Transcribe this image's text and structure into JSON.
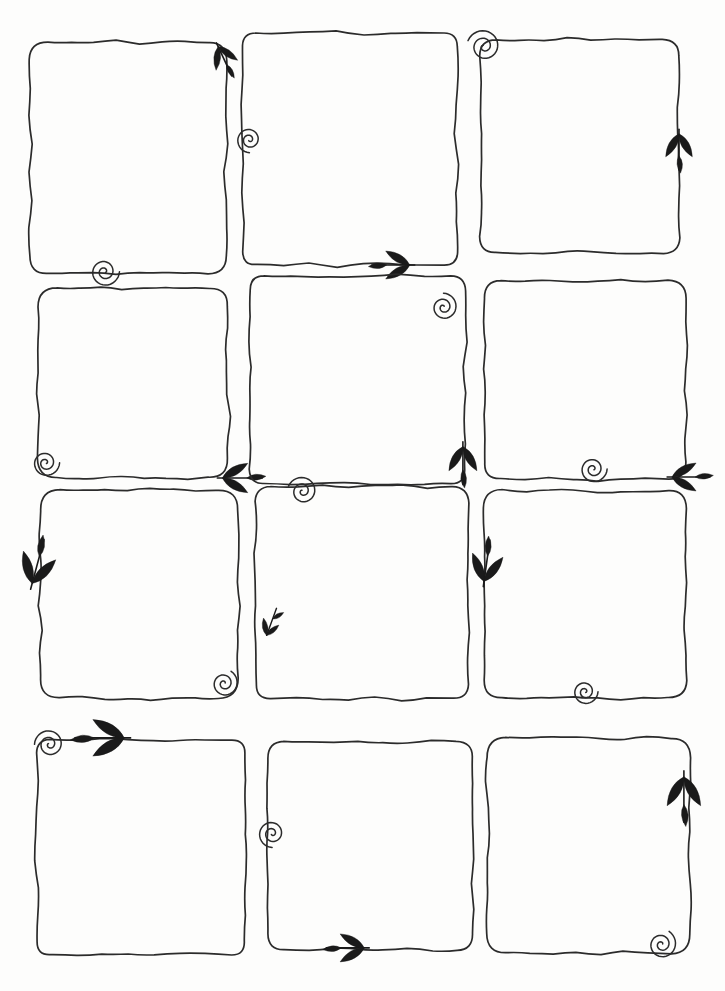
{
  "document": {
    "kind": "hand-drawn-template-sheet",
    "title": "Blank hand-drawn square frames grid",
    "medium": "ink pen on white paper",
    "background_color": "#fdfdfc",
    "ink_color": "#2b2b2b",
    "ornament_color": "#1a1a1a",
    "width": 725,
    "height": 991,
    "frame_count": 12,
    "grid": {
      "columns": 3,
      "rows": 4
    },
    "text_content": "none - all frames are empty"
  },
  "frames": [
    {
      "id": "frame-r1c1",
      "row": 1,
      "col": 1,
      "x": 30,
      "y": 42,
      "w": 196,
      "h": 232,
      "ornaments": [
        {
          "name": "leaf-arrow-down",
          "direction": "down",
          "edge": "top-right",
          "ox": 0.96,
          "oy": 0.02,
          "size": 34,
          "rot": 155
        },
        {
          "name": "spiral-curl",
          "edge": "bottom-left",
          "ox": 0.38,
          "oy": 0.99,
          "size": 15,
          "rot": 0
        }
      ]
    },
    {
      "id": "frame-r1c2",
      "row": 1,
      "col": 2,
      "x": 243,
      "y": 33,
      "w": 214,
      "h": 232,
      "ornaments": [
        {
          "name": "spiral-curl",
          "edge": "left-upper",
          "ox": 0.03,
          "oy": 0.46,
          "size": 13,
          "rot": 90
        },
        {
          "name": "leaf-arrow-right",
          "direction": "right",
          "edge": "bottom-right",
          "ox": 0.78,
          "oy": 1.0,
          "size": 40,
          "rot": 0
        }
      ]
    },
    {
      "id": "frame-r1c3",
      "row": 1,
      "col": 3,
      "x": 480,
      "y": 40,
      "w": 199,
      "h": 213,
      "ornaments": [
        {
          "name": "spiral-curl",
          "edge": "top-left",
          "ox": 0.02,
          "oy": 0.03,
          "size": 17,
          "rot": 200
        },
        {
          "name": "leaf-arrow-up",
          "direction": "up",
          "edge": "right",
          "ox": 1.0,
          "oy": 0.44,
          "size": 38,
          "rot": 0
        }
      ]
    },
    {
      "id": "frame-r2c1",
      "row": 2,
      "col": 1,
      "x": 38,
      "y": 288,
      "w": 190,
      "h": 190,
      "ornaments": [
        {
          "name": "spiral-curl",
          "edge": "bottom-left",
          "ox": 0.04,
          "oy": 0.92,
          "size": 14,
          "rot": 0
        },
        {
          "name": "leaf-arrow-left",
          "direction": "left",
          "edge": "bottom-right",
          "ox": 0.97,
          "oy": 1.0,
          "size": 42,
          "rot": 0
        }
      ]
    },
    {
      "id": "frame-r2c2",
      "row": 2,
      "col": 2,
      "x": 250,
      "y": 276,
      "w": 215,
      "h": 208,
      "ornaments": [
        {
          "name": "spiral-curl",
          "edge": "top-right",
          "ox": 0.9,
          "oy": 0.15,
          "size": 14,
          "rot": 270
        },
        {
          "name": "leaf-arrow-up",
          "direction": "up",
          "edge": "bottom-right",
          "ox": 0.99,
          "oy": 0.82,
          "size": 40,
          "rot": 0
        }
      ]
    },
    {
      "id": "frame-r2c3",
      "row": 2,
      "col": 3,
      "x": 484,
      "y": 281,
      "w": 202,
      "h": 198,
      "ornaments": [
        {
          "name": "spiral-curl",
          "edge": "bottom-left-inner",
          "ox": 0.54,
          "oy": 0.95,
          "size": 14,
          "rot": 0
        },
        {
          "name": "leaf-arrow-left",
          "direction": "left",
          "edge": "bottom-right",
          "ox": 0.93,
          "oy": 0.99,
          "size": 40,
          "rot": 0
        }
      ]
    },
    {
      "id": "frame-r3c1",
      "row": 3,
      "col": 1,
      "x": 40,
      "y": 490,
      "w": 198,
      "h": 208,
      "ornaments": [
        {
          "name": "leaf-arrow-down",
          "direction": "down",
          "edge": "left",
          "ox": -0.04,
          "oy": 0.45,
          "size": 48,
          "rot": 15
        },
        {
          "name": "spiral-curl",
          "edge": "bottom-right",
          "ox": 0.93,
          "oy": 0.93,
          "size": 14,
          "rot": 300
        }
      ]
    },
    {
      "id": "frame-r3c2",
      "row": 3,
      "col": 2,
      "x": 256,
      "y": 487,
      "w": 212,
      "h": 212,
      "ornaments": [
        {
          "name": "spiral-curl",
          "edge": "top-left-inner",
          "ox": 0.22,
          "oy": 0.02,
          "size": 15,
          "rot": 200
        },
        {
          "name": "leaf-sprig-down",
          "direction": "down",
          "edge": "left-lower",
          "ox": 0.05,
          "oy": 0.7,
          "size": 32,
          "rot": 20
        }
      ]
    },
    {
      "id": "frame-r3c3",
      "row": 3,
      "col": 3,
      "x": 484,
      "y": 490,
      "w": 202,
      "h": 208,
      "ornaments": [
        {
          "name": "leaf-arrow-down",
          "direction": "down",
          "edge": "left",
          "ox": 0.0,
          "oy": 0.44,
          "size": 44,
          "rot": 8
        },
        {
          "name": "spiral-curl",
          "edge": "bottom-center",
          "ox": 0.5,
          "oy": 0.97,
          "size": 13,
          "rot": 0
        }
      ]
    },
    {
      "id": "frame-r4c1",
      "row": 4,
      "col": 1,
      "x": 37,
      "y": 740,
      "w": 208,
      "h": 215,
      "ornaments": [
        {
          "name": "spiral-curl",
          "edge": "top-left",
          "ox": 0.06,
          "oy": 0.02,
          "size": 15,
          "rot": 180
        },
        {
          "name": "leaf-arrow-right",
          "direction": "right",
          "edge": "top",
          "ox": 0.42,
          "oy": -0.01,
          "size": 52,
          "rot": 0
        }
      ]
    },
    {
      "id": "frame-r4c2",
      "row": 4,
      "col": 2,
      "x": 268,
      "y": 742,
      "w": 205,
      "h": 208,
      "ornaments": [
        {
          "name": "spiral-curl",
          "edge": "left",
          "ox": 0.02,
          "oy": 0.44,
          "size": 14,
          "rot": 90
        },
        {
          "name": "leaf-arrow-right",
          "direction": "right",
          "edge": "bottom",
          "ox": 0.47,
          "oy": 0.99,
          "size": 40,
          "rot": 0
        }
      ]
    },
    {
      "id": "frame-r4c3",
      "row": 4,
      "col": 3,
      "x": 487,
      "y": 738,
      "w": 203,
      "h": 215,
      "ornaments": [
        {
          "name": "leaf-arrow-up",
          "direction": "up",
          "edge": "right-upper",
          "ox": 0.97,
          "oy": 0.18,
          "size": 48,
          "rot": 0
        },
        {
          "name": "spiral-curl",
          "edge": "bottom-right",
          "ox": 0.86,
          "oy": 0.96,
          "size": 15,
          "rot": 300
        }
      ]
    }
  ]
}
